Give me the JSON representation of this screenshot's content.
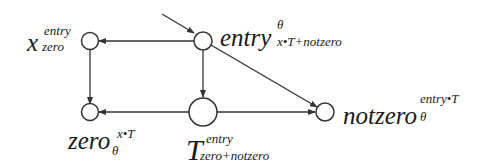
{
  "diagram": {
    "nodes": [
      {
        "id": "x_zero",
        "base": "x",
        "sub": "zero",
        "sup": "entry"
      },
      {
        "id": "entry",
        "base": "entry",
        "sub": "x•T+notzero",
        "sup": "θ"
      },
      {
        "id": "zero",
        "base": "zero",
        "sub": "θ",
        "sup": "x•T"
      },
      {
        "id": "T",
        "base": "T",
        "sub": "zero+notzero",
        "sup": "entry"
      },
      {
        "id": "notzero",
        "base": "notzero",
        "sub": "θ",
        "sup": "entry•T"
      }
    ],
    "edges": [
      {
        "from": "start",
        "to": "entry"
      },
      {
        "from": "entry",
        "to": "x_zero"
      },
      {
        "from": "entry",
        "to": "T"
      },
      {
        "from": "entry",
        "to": "notzero"
      },
      {
        "from": "x_zero",
        "to": "zero"
      },
      {
        "from": "T",
        "to": "zero"
      },
      {
        "from": "T",
        "to": "notzero"
      }
    ],
    "stroke_color": "#333333"
  }
}
